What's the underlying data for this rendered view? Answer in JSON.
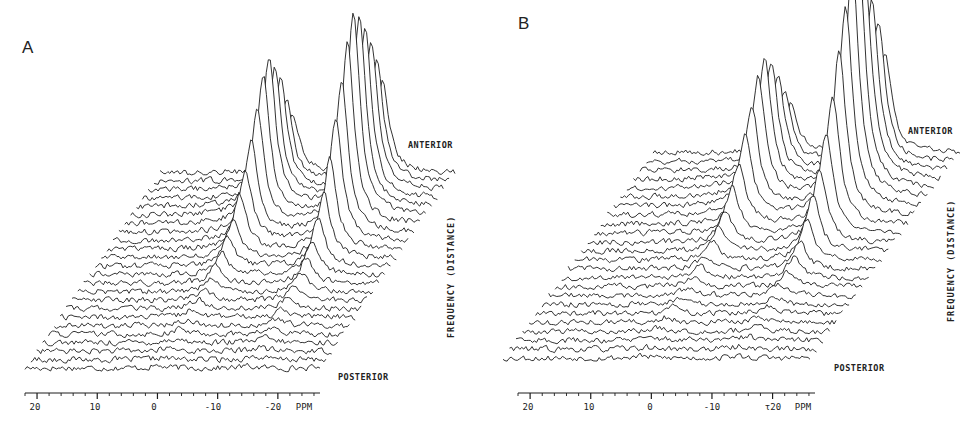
{
  "figure": {
    "panels": [
      {
        "id": "A",
        "letter": "A",
        "anterior_label": "ANTERIOR",
        "posterior_label": "POSTERIOR",
        "vertical_label": "FREQUENCY  (DISTANCE)",
        "axis_unit": "PPM",
        "tick_labels": [
          "20",
          "10",
          "0",
          "-10",
          "-20"
        ]
      },
      {
        "id": "B",
        "letter": "B",
        "anterior_label": "ANTERIOR",
        "posterior_label": "POSTERIOR",
        "vertical_label": "FREQUENCY  (DISTANCE)",
        "axis_unit": "PPM",
        "tick_labels": [
          "20",
          "10",
          "0",
          "-10",
          "τ20"
        ]
      }
    ]
  },
  "chart_data": [
    {
      "type": "line",
      "title": "A",
      "subtype": "stacked spectra (waterfall plot)",
      "xlabel": "PPM",
      "ylabel": "FREQUENCY (DISTANCE)",
      "x_ticks": [
        20,
        10,
        0,
        -10,
        -20
      ],
      "xlim": [
        22,
        -27
      ],
      "y_direction": {
        "front": "POSTERIOR",
        "back": "ANTERIOR"
      },
      "n_traces": 24,
      "peaks_ppm": [
        0,
        -15
      ],
      "peak_max_relative_height": {
        "0": 0.75,
        "-15": 1.0
      },
      "notes": "Two resonances near 0 ppm and about -15 ppm, strongest in mid/back traces; flat noisy baseline elsewhere"
    },
    {
      "type": "line",
      "title": "B",
      "subtype": "stacked spectra (waterfall plot)",
      "xlabel": "PPM",
      "ylabel": "FREQUENCY (DISTANCE)",
      "x_ticks": [
        20,
        10,
        0,
        -10,
        -20
      ],
      "xlim": [
        22,
        -27
      ],
      "y_direction": {
        "front": "POSTERIOR",
        "back": "ANTERIOR"
      },
      "n_traces": 24,
      "peaks_ppm": [
        0,
        -15
      ],
      "peak_max_relative_height": {
        "0": 0.6,
        "-15": 1.0
      },
      "notes": "Same two resonances; the -15 ppm peak dominates more strongly than in A"
    }
  ],
  "render": {
    "panelA": {
      "axis": {
        "x0": 25,
        "x1": 320,
        "y": 393,
        "ppm_left": 22,
        "ppm_right": -27,
        "tick_ppm": [
          20,
          10,
          0,
          -10,
          -20
        ]
      },
      "plot": {
        "front_x0": 25,
        "front_x1": 320,
        "front_y": 368,
        "back_dx": 135,
        "back_dy": -195,
        "traces": 24
      },
      "labels": {
        "letter": [
          22,
          40
        ],
        "anterior": [
          408,
          143
        ],
        "posterior": [
          338,
          374
        ],
        "vertical": [
          447,
          338
        ],
        "ppm": [
          296,
          398
        ]
      },
      "peaks": [
        {
          "ppm": 0.0,
          "width": 1.3,
          "amp": [
            2,
            2,
            3,
            4,
            5,
            6,
            8,
            10,
            12,
            14,
            18,
            22,
            30,
            40,
            55,
            70,
            90,
            115,
            140,
            150,
            130,
            110,
            80,
            60
          ]
        },
        {
          "ppm": -15.0,
          "width": 1.3,
          "amp": [
            2,
            3,
            4,
            5,
            6,
            7,
            9,
            12,
            15,
            20,
            25,
            35,
            48,
            65,
            90,
            120,
            150,
            180,
            200,
            190,
            170,
            150,
            120,
            90
          ]
        }
      ],
      "seed": 17
    },
    "panelB": {
      "axis": {
        "x0": 28,
        "x1": 325,
        "y": 393,
        "ppm_left": 22,
        "ppm_right": -27,
        "tick_ppm": [
          20,
          10,
          0,
          -10,
          -20
        ]
      },
      "plot": {
        "front_x0": 13,
        "front_x1": 320,
        "front_y": 358,
        "back_dx": 150,
        "back_dy": -205,
        "traces": 24
      },
      "labels": {
        "letter": [
          28,
          16
        ],
        "anterior": [
          418,
          128
        ],
        "posterior": [
          344,
          365
        ],
        "vertical": [
          947,
          322
        ],
        "ppm": [
          303,
          398
        ]
      },
      "peaks": [
        {
          "ppm": 0.0,
          "width": 1.3,
          "amp": [
            2,
            2,
            3,
            4,
            5,
            6,
            7,
            8,
            10,
            12,
            14,
            18,
            24,
            32,
            45,
            60,
            80,
            100,
            120,
            130,
            115,
            95,
            70,
            50
          ]
        },
        {
          "ppm": -15.0,
          "width": 1.3,
          "amp": [
            2,
            3,
            4,
            5,
            6,
            7,
            9,
            12,
            15,
            20,
            28,
            40,
            55,
            75,
            100,
            130,
            165,
            200,
            230,
            225,
            200,
            170,
            140,
            100
          ]
        }
      ],
      "seed": 53
    },
    "colors": {
      "line": "#1c1c1c",
      "background": "#ffffff"
    }
  }
}
